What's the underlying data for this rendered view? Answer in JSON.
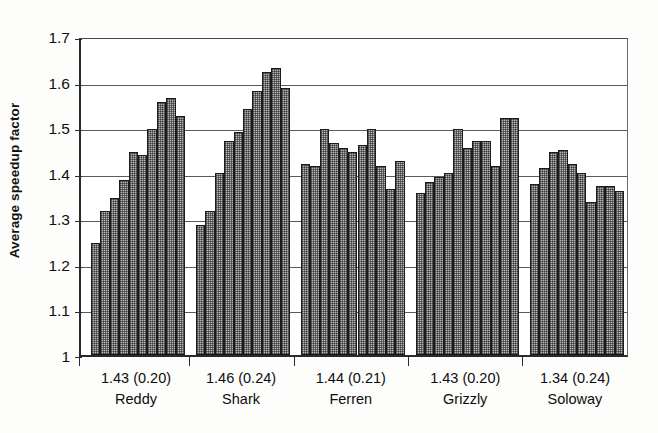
{
  "chart_data": {
    "type": "bar",
    "title": "",
    "xlabel": "",
    "ylabel": "Average speedup factor",
    "ylim": [
      1.0,
      1.7
    ],
    "ytick_labels": [
      "1.7",
      "1.6",
      "1.5",
      "1.4",
      "1.3",
      "1.2",
      "1.1",
      "1"
    ],
    "ytick_values": [
      1.7,
      1.6,
      1.5,
      1.4,
      1.3,
      1.2,
      1.1,
      1.0
    ],
    "grid": "horizontal",
    "legend": "none",
    "categories": [
      "Reddy",
      "Shark",
      "Ferren",
      "Grizzly",
      "Soloway"
    ],
    "group_annotations": [
      "1.43 (0.20)",
      "1.46 (0.24)",
      "1.44 (0.21)",
      "1.43 (0.20)",
      "1.34 (0.24)"
    ],
    "groups": [
      {
        "name": "Reddy",
        "mean": 1.43,
        "sd": 0.2,
        "annotation": "1.43 (0.20)",
        "values": [
          1.245,
          1.315,
          1.345,
          1.385,
          1.445,
          1.44,
          1.495,
          1.555,
          1.565,
          1.525
        ]
      },
      {
        "name": "Shark",
        "mean": 1.46,
        "sd": 0.24,
        "annotation": "1.46 (0.24)",
        "values": [
          1.285,
          1.315,
          1.4,
          1.47,
          1.49,
          1.54,
          1.58,
          1.62,
          1.63,
          1.585
        ]
      },
      {
        "name": "Ferren",
        "mean": 1.44,
        "sd": 0.21,
        "annotation": "1.44 (0.21)",
        "values": [
          1.42,
          1.415,
          1.495,
          1.465,
          1.455,
          1.445,
          1.46,
          1.495,
          1.415,
          1.365,
          1.425
        ]
      },
      {
        "name": "Grizzly",
        "mean": 1.43,
        "sd": 0.2,
        "annotation": "1.43 (0.20)",
        "values": [
          1.355,
          1.38,
          1.39,
          1.4,
          1.495,
          1.455,
          1.47,
          1.47,
          1.415,
          1.52,
          1.52
        ]
      },
      {
        "name": "Soloway",
        "mean": 1.34,
        "sd": 0.24,
        "annotation": "1.34 (0.24)",
        "values": [
          1.375,
          1.41,
          1.445,
          1.45,
          1.42,
          1.4,
          1.335,
          1.37,
          1.37,
          1.36
        ]
      }
    ],
    "style": {
      "bar_fill": "#b6b6b6",
      "bar_edge": "#1b1b1b",
      "gridline_color": "#5c5c5c",
      "axis_color": "#2a2a2a",
      "background": "#ffffff"
    }
  }
}
